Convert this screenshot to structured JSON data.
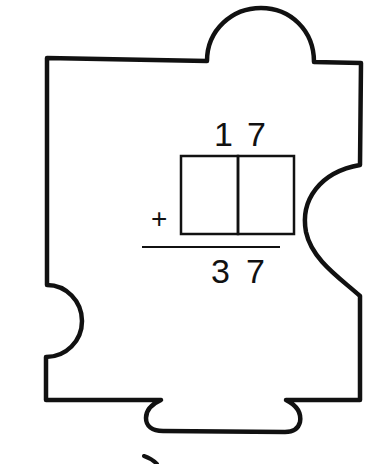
{
  "problem": {
    "addend_top": [
      "1",
      "7"
    ],
    "addend_missing": [
      "",
      ""
    ],
    "operator": "+",
    "sum": [
      "3",
      "7"
    ]
  },
  "colors": {
    "ink": "#111111",
    "background": "#ffffff"
  }
}
